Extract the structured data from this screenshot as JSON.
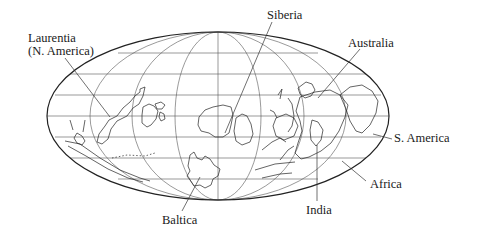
{
  "figure": {
    "projection": "Mollweide-style ellipse with graticule",
    "colors": {
      "line": "#222222",
      "grid": "#555555",
      "background": "#ffffff"
    },
    "ellipse": {
      "cx": 218,
      "cy": 116,
      "rx": 171,
      "ry": 84
    }
  },
  "labels": [
    {
      "id": "laurentia",
      "line1": "Laurentia",
      "line2": "(N. America)"
    },
    {
      "id": "siberia",
      "line1": "Siberia"
    },
    {
      "id": "australia",
      "line1": "Australia"
    },
    {
      "id": "s-america",
      "line1": "S. America"
    },
    {
      "id": "africa",
      "line1": "Africa"
    },
    {
      "id": "india",
      "line1": "India"
    },
    {
      "id": "baltica",
      "line1": "Baltica"
    }
  ]
}
